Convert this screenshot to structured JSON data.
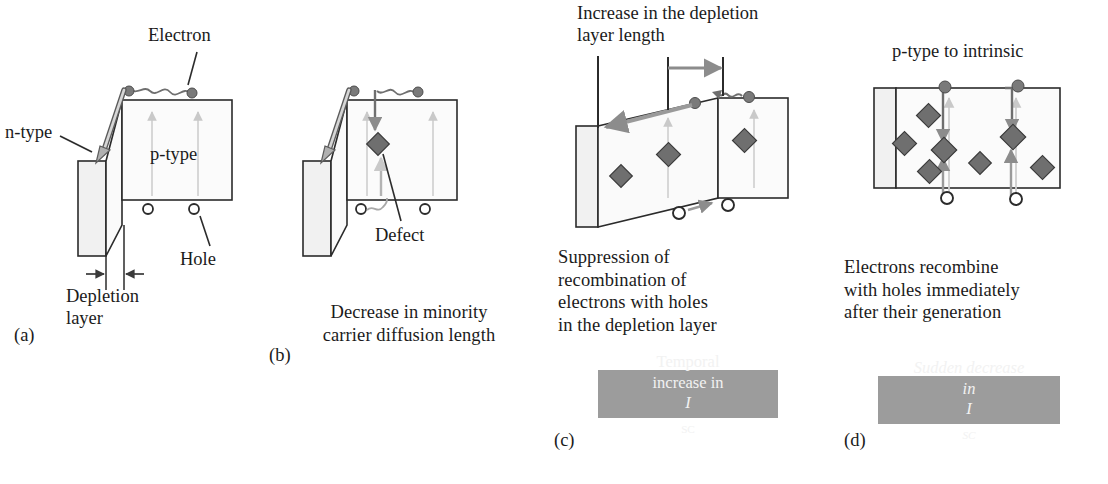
{
  "figure": {
    "type": "diagram"
  },
  "colors": {
    "outline": "#2b2b2b",
    "fill_light": "#f4f4f4",
    "fill_white": "#fcfcfc",
    "carrier_gray": "#7a7a7a",
    "arrow_gray": "#8c8c8c",
    "arrow_light": "#c9c9c9",
    "graybox_bg": "#9c9c9c",
    "graybox_text": "#f2f2f2",
    "text": "#1b1b1b"
  },
  "panels": [
    {
      "id": "(a)",
      "name": "pristine-junction",
      "labels": {
        "electron": "Electron",
        "ntype": "n-type",
        "ptype": "p-type",
        "hole": "Hole",
        "depletion_line1": "Depletion",
        "depletion_line2": "layer"
      }
    },
    {
      "id": "(b)",
      "name": "defect-recombination",
      "labels": {
        "defect": "Defect"
      },
      "caption_line1": "Decrease in minority",
      "caption_line2": "carrier diffusion length"
    },
    {
      "id": "(c)",
      "name": "depletion-layer-increase",
      "labels": {
        "top_line1": "Increase in the depletion",
        "top_line2": "layer length"
      },
      "caption_line1": "Suppression of",
      "caption_line2": "recombination of",
      "caption_line3": "electrons with holes",
      "caption_line4": "in the depletion layer",
      "result_box": {
        "line1": "Temporal",
        "line2_pre": "increase in ",
        "line2_symbol": "I",
        "line2_subscript": "SC",
        "italic": false
      }
    },
    {
      "id": "(d)",
      "name": "p-type-to-intrinsic",
      "labels": {
        "top": "p-type to intrinsic"
      },
      "caption_line1": "Electrons recombine",
      "caption_line2": "with holes immediately",
      "caption_line3": "after their generation",
      "result_box": {
        "line1": "Sudden decrease",
        "line2_pre": "in ",
        "line2_symbol": "I",
        "line2_subscript": "SC",
        "italic": true
      }
    }
  ]
}
